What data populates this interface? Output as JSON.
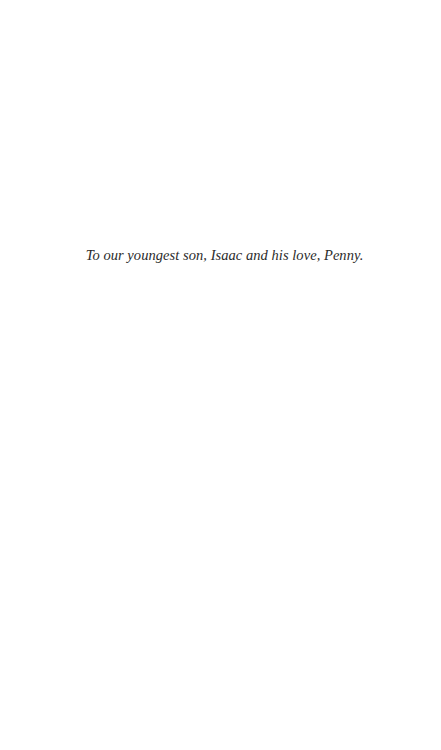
{
  "page": {
    "background": "#ffffff",
    "text_color": "#2b2b2b"
  },
  "dedication": {
    "text": "To our youngest son, Isaac and his love, Penny."
  }
}
